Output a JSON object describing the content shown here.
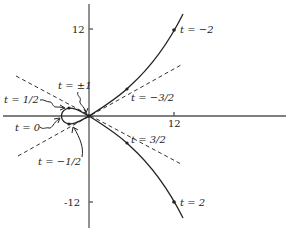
{
  "diagram": {
    "type": "parametric-curve",
    "axes": {
      "x_tick_label": "12",
      "y_tick_labels": [
        "12",
        "-12"
      ]
    },
    "point_labels": [
      {
        "id": "t-neg2",
        "text": "t = −2"
      },
      {
        "id": "t-neg3-2",
        "text": "t = −3/2"
      },
      {
        "id": "t-pm1",
        "text": "t = ±1"
      },
      {
        "id": "t-1-2",
        "text": "t = 1/2"
      },
      {
        "id": "t-0",
        "text": "t = 0"
      },
      {
        "id": "t-neg1-2",
        "text": "t = −1/2"
      },
      {
        "id": "t-3-2",
        "text": "t = 3/2"
      },
      {
        "id": "t-2",
        "text": "t = 2"
      }
    ],
    "asymptotes": 2,
    "colors": {
      "curve": "#222222",
      "axis": "#555555"
    }
  }
}
